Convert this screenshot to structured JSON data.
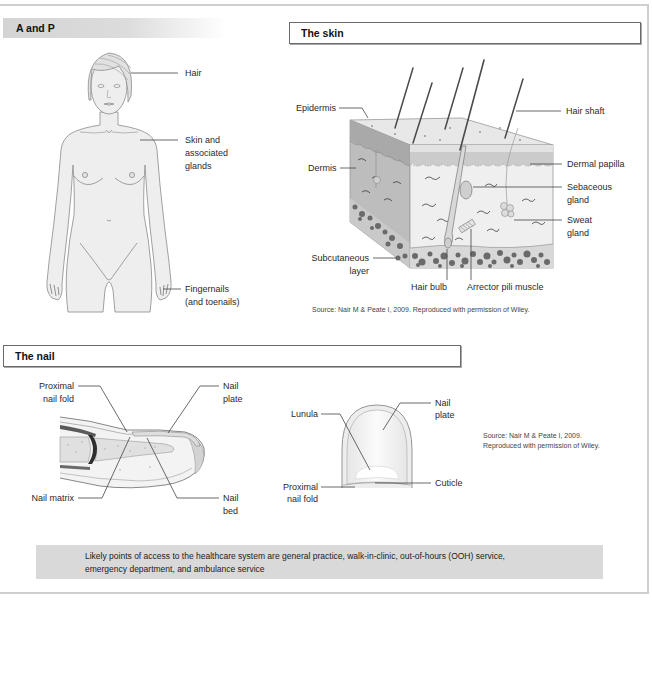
{
  "anatomy_panel": {
    "title": "A and P",
    "labels": {
      "hair": "Hair",
      "skin_glands": [
        "Skin and",
        "associated",
        "glands"
      ],
      "nails": [
        "Fingernails",
        "(and toenails)"
      ]
    }
  },
  "skin_panel": {
    "title": "The skin",
    "labels": {
      "epidermis": "Epidermis",
      "dermis": "Dermis",
      "subcutaneous_layer": [
        "Subcutaneous",
        "layer"
      ],
      "hair_bulb": "Hair bulb",
      "arrector_pili_muscle": "Arrector pili muscle",
      "hair_shaft": "Hair shaft",
      "dermal_papilla": "Dermal papilla",
      "sebaceous_gland": [
        "Sebaceous",
        "gland"
      ],
      "sweat_gland": [
        "Sweat",
        "gland"
      ]
    },
    "source": "Source: Nair M & Peate I, 2009. Reproduced with permission of Wiley."
  },
  "nail_panel": {
    "title": "The nail",
    "side_view_labels": {
      "proximal_nail_fold": [
        "Proximal",
        "nail fold"
      ],
      "nail_plate": [
        "Nail",
        "plate"
      ],
      "nail_matrix": "Nail matrix",
      "nail_bed": [
        "Nail",
        "bed"
      ]
    },
    "front_view_labels": {
      "lunula": "Lunula",
      "nail_plate": [
        "Nail",
        "plate"
      ],
      "cuticle": "Cuticle",
      "proximal_nail_fold": [
        "Proximal",
        "nail fold"
      ]
    },
    "source": [
      "Source: Nair M & Peate I, 2009.",
      "Reproduced with permission of Wiley."
    ]
  },
  "note": {
    "lines": [
      "Likely points of access to the healthcare system are general practice, walk-in-clinic, out-of-hours (OOH) service,",
      "emergency department, and ambulance service"
    ],
    "background": "#d9d9d9"
  }
}
